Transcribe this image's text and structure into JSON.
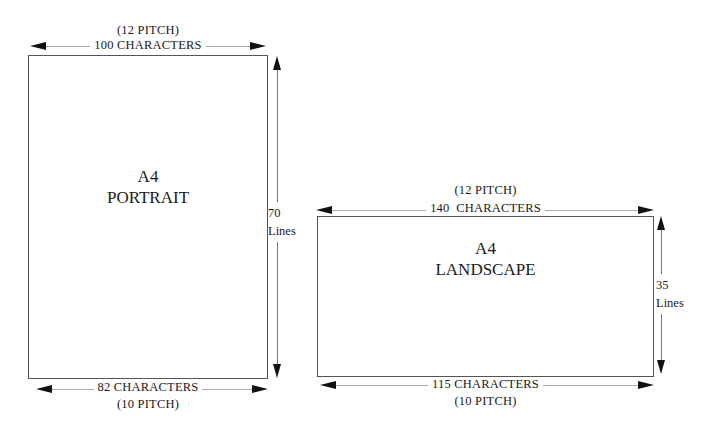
{
  "portrait": {
    "title_line1": "A4",
    "title_line2": "PORTRAIT",
    "top_pitch": "(12 PITCH)",
    "top_chars": "100 CHARACTERS",
    "bottom_chars": "82 CHARACTERS",
    "bottom_pitch": "(10 PITCH)",
    "lines_count": "70",
    "lines_label": "Lines"
  },
  "landscape": {
    "title_line1": "A4",
    "title_line2": "LANDSCAPE",
    "top_pitch": "(12 PITCH)",
    "top_chars": "140  CHARACTERS",
    "bottom_chars": "115 CHARACTERS",
    "bottom_pitch": "(10 PITCH)",
    "lines_count": "35",
    "lines_label": "Lines"
  }
}
